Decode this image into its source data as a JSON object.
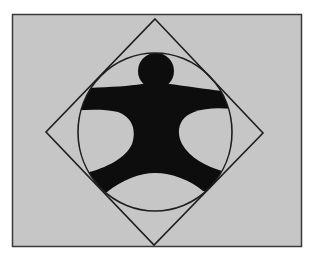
{
  "diagram": {
    "colors": {
      "page_background": "#ffffff",
      "field": "#c6c6c6",
      "frame_stroke": "#3a3a3a",
      "line_stroke": "#1e1e1e",
      "figure_fill": "#0d0d0d"
    },
    "field": {
      "x": 12,
      "y": 14,
      "width": 289,
      "height": 232
    },
    "diamond": {
      "top": [
        155,
        19
      ],
      "right": [
        263,
        133
      ],
      "bottom": [
        154,
        245
      ],
      "left": [
        46,
        132
      ]
    },
    "circle": {
      "cx": 155,
      "cy": 132,
      "rx": 77,
      "ry": 79
    },
    "figure": {
      "head": {
        "cx": 156,
        "cy": 71,
        "r": 18
      },
      "parts": [
        "head",
        "arms",
        "torso",
        "legs"
      ]
    }
  }
}
